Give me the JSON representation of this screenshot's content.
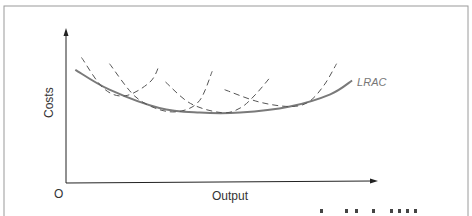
{
  "chart_data": {
    "type": "line",
    "title": "",
    "xlabel": "Output",
    "ylabel": "Costs",
    "origin_label": "O",
    "grid": false,
    "ticks": "none",
    "series": [
      {
        "name": "LRAC",
        "label": "LRAC",
        "style": "solid",
        "color": "#7a7a7a",
        "points": [
          [
            0.03,
            0.74
          ],
          [
            0.14,
            0.61
          ],
          [
            0.3,
            0.49
          ],
          [
            0.43,
            0.46
          ],
          [
            0.56,
            0.46
          ],
          [
            0.72,
            0.5
          ],
          [
            0.85,
            0.58
          ],
          [
            0.92,
            0.67
          ]
        ]
      },
      {
        "name": "SRAC1",
        "style": "dashed",
        "color": "#555555",
        "points": [
          [
            0.05,
            0.82
          ],
          [
            0.12,
            0.62
          ],
          [
            0.19,
            0.57
          ],
          [
            0.27,
            0.66
          ],
          [
            0.3,
            0.77
          ]
        ]
      },
      {
        "name": "SRAC2",
        "style": "dashed",
        "color": "#555555",
        "points": [
          [
            0.14,
            0.78
          ],
          [
            0.22,
            0.57
          ],
          [
            0.3,
            0.48
          ],
          [
            0.37,
            0.47
          ],
          [
            0.43,
            0.54
          ],
          [
            0.47,
            0.73
          ]
        ]
      },
      {
        "name": "SRAC3",
        "style": "dashed",
        "color": "#555555",
        "points": [
          [
            0.32,
            0.66
          ],
          [
            0.4,
            0.52
          ],
          [
            0.5,
            0.46
          ],
          [
            0.56,
            0.49
          ],
          [
            0.61,
            0.58
          ],
          [
            0.66,
            0.7
          ]
        ]
      },
      {
        "name": "SRAC4",
        "style": "dashed",
        "color": "#555555",
        "points": [
          [
            0.51,
            0.61
          ],
          [
            0.62,
            0.53
          ],
          [
            0.72,
            0.5
          ],
          [
            0.78,
            0.53
          ],
          [
            0.83,
            0.64
          ],
          [
            0.87,
            0.78
          ]
        ]
      }
    ],
    "legend": "inline-right",
    "xlim": [
      0,
      1
    ],
    "ylim": [
      0,
      1
    ]
  },
  "footer_text": "..."
}
